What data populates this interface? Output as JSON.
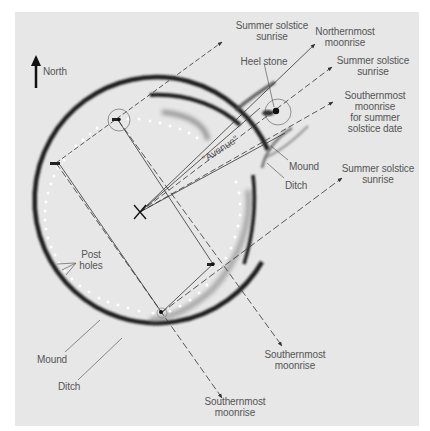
{
  "figure": {
    "panel_color": "#e7e7e7",
    "ink_color": "#2a2a2a",
    "label_color": "#555555"
  },
  "compass": {
    "icon": "north-arrow-icon",
    "label": "North"
  },
  "features": {
    "heel_stone": "Heel stone",
    "avenue": "\"Avenue\"",
    "post_holes": "Post\nholes",
    "mound_left": "Mound",
    "ditch_left": "Ditch",
    "mound_right": "Mound",
    "ditch_right": "Ditch"
  },
  "alignments": [
    {
      "id": "top-summer-sunrise",
      "label": "Summer solstice\nsunrise"
    },
    {
      "id": "northernmost-moonrise",
      "label": "Northernmost\nmoonrise"
    },
    {
      "id": "summer-sunrise-heel",
      "label": "Summer solstice\nsunrise"
    },
    {
      "id": "southernmost-moonrise-summer",
      "label": "Southernmost\nmoonrise\nfor summer\nsolstice date"
    },
    {
      "id": "right-summer-sunrise",
      "label": "Summer solstice\nsunrise"
    },
    {
      "id": "southernmost-moonrise-center",
      "label": "Southernmost\nmoonrise"
    },
    {
      "id": "southernmost-moonrise-bottom",
      "label": "Southernmost\nmoonrise"
    }
  ]
}
